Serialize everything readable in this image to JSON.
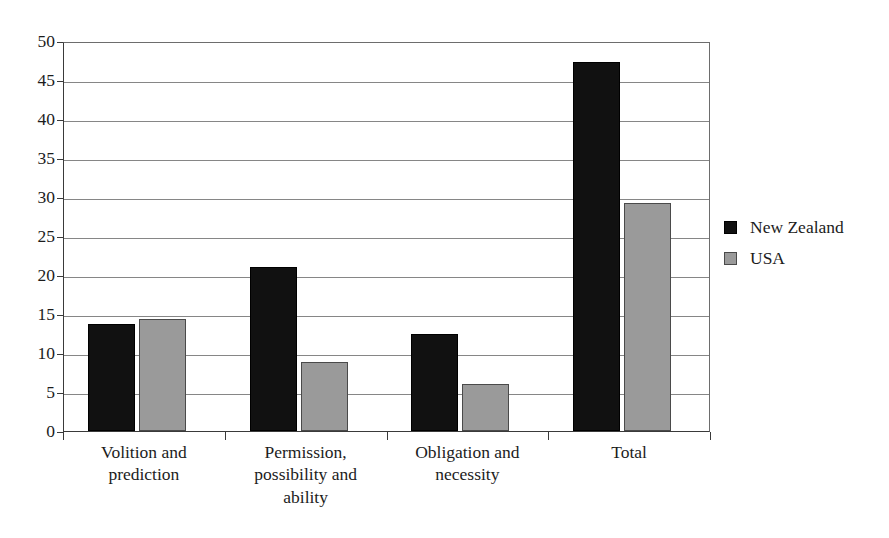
{
  "chart_data": {
    "type": "bar",
    "title": "",
    "subtitle": "",
    "xlabel": "",
    "ylabel": "",
    "ylim": [
      0,
      50
    ],
    "ytick_step": 5,
    "yticks": [
      "50",
      "45",
      "40",
      "35",
      "30",
      "25",
      "20",
      "15",
      "10",
      "5",
      "0"
    ],
    "ytick_values": [
      50,
      45,
      40,
      35,
      30,
      25,
      20,
      15,
      10,
      5,
      0
    ],
    "grid": true,
    "grid_axis": "y",
    "legend_position": "right",
    "categories": [
      "Volition and prediction",
      "Permission, possibility and ability",
      "Obligation and necessity",
      "Total"
    ],
    "category_label_lines": [
      [
        "Volition and",
        "prediction"
      ],
      [
        "Permission,",
        "possibility and",
        "ability"
      ],
      [
        "Obligation and",
        "necessity"
      ],
      [
        "Total"
      ]
    ],
    "series": [
      {
        "name": "New Zealand",
        "color": "#111111",
        "values": [
          13.7,
          21.0,
          12.5,
          47.3
        ]
      },
      {
        "name": "USA",
        "color": "#9a9a9a",
        "values": [
          14.3,
          8.8,
          6.0,
          29.2
        ]
      }
    ]
  },
  "legend": {
    "items": [
      {
        "label": "New Zealand",
        "swatch": "black-square-swatch"
      },
      {
        "label": "USA",
        "swatch": "gray-square-swatch"
      }
    ]
  },
  "axis": {
    "y_labels": [
      "50",
      "45",
      "40",
      "35",
      "30",
      "25",
      "20",
      "15",
      "10",
      "5",
      "0"
    ],
    "x_labels": [
      "Volition and prediction",
      "Permission, possibility and ability",
      "Obligation and necessity",
      "Total"
    ]
  }
}
